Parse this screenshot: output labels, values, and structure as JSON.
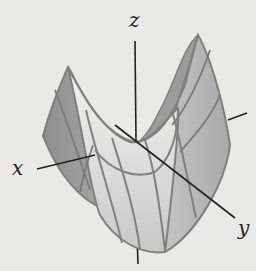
{
  "figure": {
    "axes": {
      "x_label": "x",
      "y_label": "y",
      "z_label": "z"
    },
    "colors": {
      "background": "#e9e9e7",
      "surface_dark": "#8d8d8d",
      "surface_mid": "#b2b2b2",
      "surface_light": "#e4e4e4",
      "grid_line": "#808080",
      "axis_line": "#222222"
    }
  }
}
